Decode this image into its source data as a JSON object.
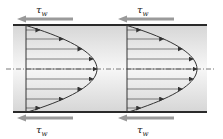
{
  "diagram": {
    "title": "",
    "colors": {
      "wall": "#2a2a2a",
      "fluid_edge": "#d6d6d6",
      "fluid_center": "#f7f7f7",
      "shear_arrow": "#9a9a9a",
      "profile_line": "#333333",
      "centerline": "#555555"
    },
    "labels": {
      "top_left": {
        "symbol": "τ",
        "subscript": "w"
      },
      "top_right": {
        "symbol": "τ",
        "subscript": "w"
      },
      "bottom_left": {
        "symbol": "τ",
        "subscript": "w"
      },
      "bottom_right": {
        "symbol": "τ",
        "subscript": "w"
      }
    },
    "profiles": [
      {
        "name": "profile-1",
        "base_x": 26,
        "vertex_x": 97
      },
      {
        "name": "profile-2",
        "base_x": 127,
        "vertex_x": 197
      }
    ],
    "arrow_rows_y": [
      30,
      39,
      49,
      59,
      69,
      79,
      89,
      99,
      108
    ],
    "pipe": {
      "x0": 13,
      "x1": 207,
      "top_y": 25,
      "bottom_y": 112,
      "center_y": 69
    }
  }
}
